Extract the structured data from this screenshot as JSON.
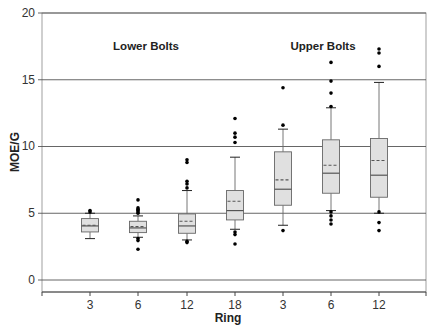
{
  "chart_data": {
    "type": "box",
    "title": "",
    "xlabel": "Ring",
    "ylabel": "MOE/G",
    "ylim": [
      -1,
      20
    ],
    "yticks": [
      0,
      5,
      10,
      15,
      20
    ],
    "grid": true,
    "categories": [
      "3",
      "6",
      "12",
      "18",
      "3",
      "6",
      "12"
    ],
    "groups": [
      {
        "name": "Lower Bolts",
        "categories": [
          "3",
          "6",
          "12",
          "18"
        ]
      },
      {
        "name": "Upper Bolts",
        "categories": [
          "3",
          "6",
          "12"
        ]
      }
    ],
    "annotations": [
      "Lower Bolts",
      "Upper Bolts"
    ],
    "series": [
      {
        "group": "Lower Bolts",
        "ring": "3",
        "q1": 3.6,
        "median": 4.05,
        "mean": 4.1,
        "q3": 4.6,
        "whisker_low": 3.1,
        "whisker_high": 5.0,
        "outliers": [
          5.1,
          5.2
        ]
      },
      {
        "group": "Lower Bolts",
        "ring": "6",
        "q1": 3.55,
        "median": 3.9,
        "mean": 4.0,
        "q3": 4.4,
        "whisker_low": 3.2,
        "whisker_high": 4.8,
        "outliers": [
          5.0,
          5.1,
          5.2,
          5.3,
          5.4,
          6.0,
          3.1,
          2.95,
          2.3
        ]
      },
      {
        "group": "Lower Bolts",
        "ring": "12",
        "q1": 3.5,
        "median": 4.05,
        "mean": 4.4,
        "q3": 4.95,
        "whisker_low": 3.0,
        "whisker_high": 6.7,
        "outliers": [
          6.9,
          7.2,
          7.4,
          8.8,
          9.0,
          2.9,
          2.8
        ]
      },
      {
        "group": "Lower Bolts",
        "ring": "18",
        "q1": 4.5,
        "median": 5.2,
        "mean": 5.9,
        "q3": 6.7,
        "whisker_low": 3.8,
        "whisker_high": 9.2,
        "outliers": [
          10.3,
          10.7,
          11.0,
          12.1,
          3.6,
          3.4,
          2.7
        ]
      },
      {
        "group": "Upper Bolts",
        "ring": "3",
        "q1": 5.6,
        "median": 6.8,
        "mean": 7.5,
        "q3": 9.6,
        "whisker_low": 4.1,
        "whisker_high": 11.3,
        "outliers": [
          11.6,
          14.4,
          3.7
        ]
      },
      {
        "group": "Upper Bolts",
        "ring": "6",
        "q1": 6.5,
        "median": 8.0,
        "mean": 8.6,
        "q3": 10.5,
        "whisker_low": 5.2,
        "whisker_high": 12.9,
        "outliers": [
          13.0,
          14.0,
          14.9,
          16.3,
          5.1,
          4.8,
          4.5,
          4.2
        ]
      },
      {
        "group": "Upper Bolts",
        "ring": "12",
        "q1": 6.2,
        "median": 7.85,
        "mean": 8.95,
        "q3": 10.6,
        "whisker_low": 5.0,
        "whisker_high": 14.8,
        "outliers": [
          16.0,
          17.0,
          17.3,
          5.1,
          4.3,
          3.7
        ]
      }
    ],
    "legend": null
  },
  "labels": {
    "y_axis_title": "MOE/G",
    "x_axis_title": "Ring",
    "annotation_left": "Lower Bolts",
    "annotation_right": "Upper Bolts",
    "ytick_0": "0",
    "ytick_5": "5",
    "ytick_10": "10",
    "ytick_15": "15",
    "ytick_20": "20",
    "xticks": [
      "3",
      "6",
      "12",
      "18",
      "3",
      "6",
      "12"
    ]
  },
  "colors": {
    "box_fill": "#e0e0e0",
    "box_stroke": "#666666",
    "median": "#555555",
    "mean": "#555555",
    "outlier": "#000000",
    "grid": "#555555",
    "axis": "#444444"
  }
}
